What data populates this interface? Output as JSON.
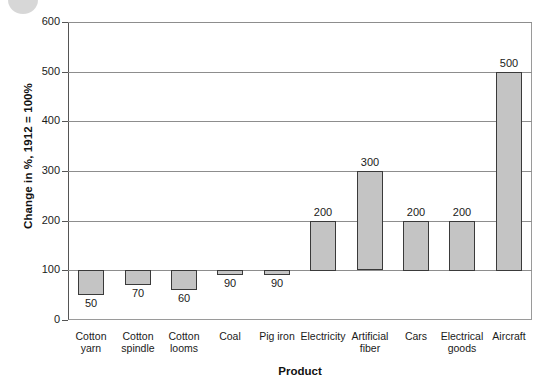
{
  "chart_data": {
    "type": "bar",
    "title": "",
    "subtitle": "",
    "xlabel": "Product",
    "ylabel": "Change in %, 1912 = 100%",
    "ylim": [
      0,
      600
    ],
    "yticks": [
      0,
      100,
      200,
      300,
      400,
      500,
      600
    ],
    "ytick_labels": [
      "0",
      "100",
      "200",
      "300",
      "400",
      "500",
      "600"
    ],
    "grid": true,
    "gridlines_at": [
      100,
      200,
      300,
      400,
      500,
      600
    ],
    "legend": null,
    "baseline": 100,
    "categories": [
      "Cotton yarn",
      "Cotton spindle",
      "Cotton looms",
      "Coal",
      "Pig iron",
      "Electricity",
      "Artificial fiber",
      "Cars",
      "Electrical goods",
      "Aircraft"
    ],
    "category_lines": [
      [
        "Cotton",
        "yarn"
      ],
      [
        "Cotton",
        "spindle"
      ],
      [
        "Cotton",
        "looms"
      ],
      [
        "Coal",
        ""
      ],
      [
        "Pig iron",
        ""
      ],
      [
        "Electricity",
        ""
      ],
      [
        "Artificial",
        "fiber"
      ],
      [
        "Cars",
        ""
      ],
      [
        "Electrical",
        "goods"
      ],
      [
        "Aircraft",
        ""
      ]
    ],
    "values": [
      50,
      70,
      60,
      90,
      90,
      200,
      300,
      200,
      200,
      500
    ],
    "data_labels": [
      "50",
      "70",
      "60",
      "90",
      "90",
      "200",
      "300",
      "200",
      "200",
      "500"
    ],
    "bar_color": "#c4c4c4",
    "bar_border_color": "#3a3a3a",
    "axis_color": "#555555",
    "grid_color": "#8d8d8d"
  },
  "decor": {
    "corner_circle": "grey-circle"
  }
}
